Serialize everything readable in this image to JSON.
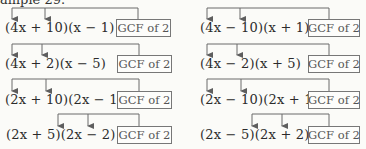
{
  "caption": "ample 29.",
  "left_column": [
    {
      "expression": "(4x + 10)(x − 1)",
      "label": "GCF of 2"
    },
    {
      "expression": "(4x + 2)(x − 5)",
      "label": "GCF of 2"
    },
    {
      "expression": "(2x + 10)(2x − 1)",
      "label": "GCF of 2"
    },
    {
      "expression": "(2x + 5)(2x − 2)",
      "label": "GCF of 2"
    }
  ],
  "right_column": [
    {
      "expression": "(4x − 10)(x + 1)",
      "label": "GCF of 2"
    },
    {
      "expression": "(4x − 2)(x + 5)",
      "label": "GCF of 2"
    },
    {
      "expression": "(2x − 10)(2x + 1)",
      "label": "GCF of 2"
    },
    {
      "expression": "(2x − 5)(2x + 2)",
      "label": "GCF of 2"
    }
  ],
  "colors": {
    "line": "#6a6a6a",
    "text": "#2b2b2b",
    "box_border": "#777777",
    "background": "#fbfbf8"
  }
}
